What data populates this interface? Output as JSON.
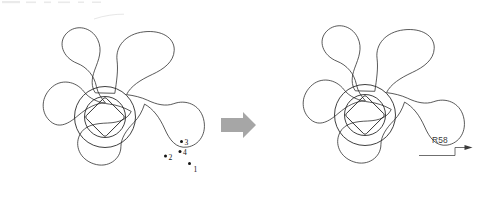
{
  "figure": {
    "background_color": "#ffffff",
    "line_color": "#2a2a2a",
    "arrow_color": "#a6a6a6",
    "label_color": "#141414",
    "dimension_color": "#3a3a3a"
  },
  "left_diagram": {
    "name": "spinner-before",
    "center_x": 105,
    "center_y": 117,
    "points": [
      {
        "id": "1",
        "label": "1",
        "x": 189.5,
        "y": 163.5,
        "label_x": 193.5,
        "label_y": 172.0
      },
      {
        "id": "2",
        "label": "2",
        "x": 165.5,
        "y": 156.0,
        "label_x": 168.5,
        "label_y": 159.5
      },
      {
        "id": "3",
        "label": "3",
        "x": 181.5,
        "y": 141.5,
        "label_x": 184.5,
        "label_y": 145.0
      },
      {
        "id": "4",
        "label": "4",
        "x": 180.0,
        "y": 151.5,
        "label_x": 183.0,
        "label_y": 155.0
      }
    ]
  },
  "transform_arrow": {
    "name": "transform-arrow",
    "direction": "right",
    "x": 221,
    "y": 112,
    "width": 34,
    "height": 26
  },
  "right_diagram": {
    "name": "spinner-after",
    "center_x": 365,
    "center_y": 115,
    "dimension": {
      "label": "R58",
      "value": 58,
      "prefix": "R",
      "label_x": 432.0,
      "label_y": 143.0,
      "leader_start_x": 419.0,
      "leader_start_y": 155.5,
      "leader_step_x": 455.0,
      "leader_mid_y": 147.5,
      "leader_end_x": 471.5
    }
  },
  "annotations": {
    "point_count": 4,
    "point_labels": [
      "1",
      "2",
      "3",
      "4"
    ],
    "dimension_labels": [
      "R58"
    ]
  }
}
